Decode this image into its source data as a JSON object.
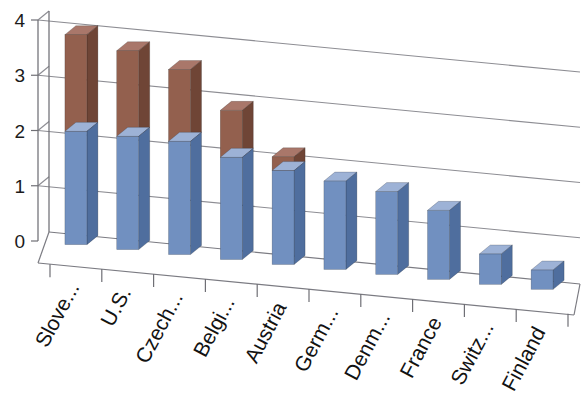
{
  "chart_data": {
    "type": "bar",
    "subtype": "stacked-column-3d",
    "title": "",
    "subtitle": "",
    "xlabel": "",
    "ylabel": "",
    "ylim": [
      0,
      4
    ],
    "yticks": [
      0,
      1,
      2,
      3,
      4
    ],
    "ytick_labels": [
      "0",
      "1",
      "2",
      "3",
      "4"
    ],
    "grid": true,
    "grid_axis": "y",
    "legend": false,
    "legend_position": "none",
    "categories": [
      "Slove...",
      "U.S.",
      "Czech...",
      "Belgi...",
      "Austria",
      "Germ...",
      "Denm...",
      "France",
      "Switz...",
      "Finland"
    ],
    "series": [
      {
        "name": "series-1",
        "color": "#7190c0",
        "values": [
          2.05,
          2.05,
          2.05,
          1.85,
          1.7,
          1.6,
          1.5,
          1.25,
          0.55,
          0.35
        ]
      },
      {
        "name": "series-2",
        "color": "#93604e",
        "values": [
          1.75,
          1.55,
          1.3,
          0.85,
          0.25,
          0,
          0,
          0,
          0,
          0
        ]
      }
    ],
    "totals": [
      3.8,
      3.6,
      3.35,
      2.7,
      1.95,
      1.6,
      1.5,
      1.25,
      0.55,
      0.35
    ]
  },
  "colors": {
    "series_1_front": "#7190c0",
    "series_1_side": "#4f6e9e",
    "series_1_top": "#9db2d6",
    "series_2_front": "#93604e",
    "series_2_side": "#6f4536",
    "series_2_top": "#a9776a",
    "gridline": "#8d8d93",
    "axis": "#6f6f75",
    "text": "#121212",
    "background": "#ffffff"
  }
}
